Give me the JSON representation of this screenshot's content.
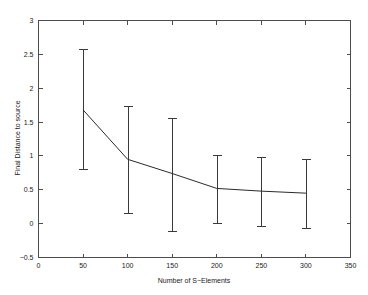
{
  "chart_data": {
    "type": "line",
    "title": "",
    "xlabel": "Number of S−Elements",
    "ylabel": "Final Distance to source",
    "xlim": [
      0,
      350
    ],
    "ylim": [
      -0.5,
      3
    ],
    "xticks": [
      0,
      50,
      100,
      150,
      200,
      250,
      300,
      350
    ],
    "xticklabels": [
      "0",
      "50",
      "100",
      "150",
      "200",
      "250",
      "300",
      "350"
    ],
    "yticks": [
      -0.5,
      0,
      0.5,
      1,
      1.5,
      2,
      2.5,
      3
    ],
    "yticklabels": [
      "−0.5",
      "0",
      "0.5",
      "1",
      "1.5",
      "2",
      "2.5",
      "3"
    ],
    "grid": false,
    "legend": null,
    "legend_position": "none",
    "series": [
      {
        "name": "Final Distance to source",
        "x": [
          50,
          100,
          150,
          200,
          250,
          300
        ],
        "values": [
          1.68,
          0.95,
          0.74,
          0.52,
          0.48,
          0.45
        ],
        "error_upper": [
          2.58,
          1.74,
          1.56,
          1.02,
          0.98,
          0.95
        ],
        "error_lower": [
          0.8,
          0.15,
          -0.11,
          0.01,
          -0.03,
          -0.06
        ],
        "line_color": "#2b2b2b",
        "errorbar_color": "#3a3a3a",
        "marker": "none"
      }
    ]
  },
  "figure": {
    "background_color": "#ffffff",
    "axis_color": "#4d4d4d",
    "text_color": "#1a1a1a"
  }
}
